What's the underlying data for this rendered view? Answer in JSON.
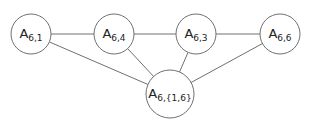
{
  "diagram": {
    "type": "graph",
    "colors": {
      "stroke": "#707070",
      "node_fill": "#ffffff",
      "text": "#222222"
    },
    "nodes": [
      {
        "id": "n1",
        "base": "A",
        "sub": "6,1",
        "cx": 31,
        "cy": 34,
        "r": 20
      },
      {
        "id": "n4",
        "base": "A",
        "sub": "6,4",
        "cx": 114,
        "cy": 34,
        "r": 20
      },
      {
        "id": "n3",
        "base": "A",
        "sub": "6,3",
        "cx": 196,
        "cy": 34,
        "r": 20
      },
      {
        "id": "n6",
        "base": "A",
        "sub": "6,6",
        "cx": 280,
        "cy": 34,
        "r": 20
      },
      {
        "id": "n16",
        "base": "A",
        "sub": "6,{1,6}",
        "cx": 170,
        "cy": 94,
        "r": 24
      }
    ],
    "edges": [
      {
        "from": "n1",
        "to": "n4"
      },
      {
        "from": "n4",
        "to": "n3"
      },
      {
        "from": "n3",
        "to": "n6"
      },
      {
        "from": "n1",
        "to": "n16"
      },
      {
        "from": "n4",
        "to": "n16"
      },
      {
        "from": "n3",
        "to": "n16"
      },
      {
        "from": "n6",
        "to": "n16"
      }
    ]
  }
}
